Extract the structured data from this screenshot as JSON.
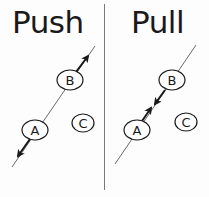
{
  "panels": {
    "push": {
      "title": "Push",
      "nodes": {
        "a": "A",
        "b": "B",
        "c": "C"
      },
      "arrows": [
        "B-to-outside-upper-right",
        "A-to-outside-lower-left"
      ]
    },
    "pull": {
      "title": "Pull",
      "nodes": {
        "a": "A",
        "b": "B",
        "c": "C"
      },
      "arrows": [
        "B-toward-middle",
        "A-toward-middle"
      ]
    }
  },
  "colors": {
    "ink": "#1a1a1a",
    "line": "#444444",
    "divider": "#7a7a7a",
    "background": "#fdfdfd"
  }
}
